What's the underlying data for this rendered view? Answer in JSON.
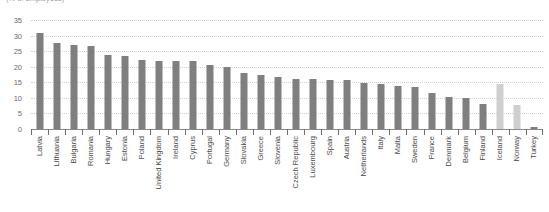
{
  "subtitle": "(% of employees)",
  "chart_data": {
    "type": "bar",
    "title": "",
    "subtitle": "(% of employees)",
    "xlabel": "",
    "ylabel": "",
    "ylim": [
      0,
      35
    ],
    "yticks": [
      0,
      5,
      10,
      15,
      20,
      25,
      30,
      35
    ],
    "grid": true,
    "legend": false,
    "orientation": "vertical",
    "categories": [
      "Latvia",
      "Lithuania",
      "Bulgaria",
      "Romania",
      "Hungary",
      "Estonia",
      "Poland",
      "United Kingdom",
      "Ireland",
      "Cyprus",
      "Portugal",
      "Germany",
      "Slovakia",
      "Greece",
      "Slovenia",
      "Czech Republic",
      "Luxembourg",
      "Spain",
      "Austria",
      "Netherlands",
      "Italy",
      "Malta",
      "Sweden",
      "France",
      "Denmark",
      "Belgium",
      "Finland",
      "Iceland",
      "Norway",
      "Turkey"
    ],
    "values": [
      30.9,
      27.6,
      27.1,
      26.7,
      23.7,
      23.4,
      22.2,
      21.8,
      21.7,
      21.7,
      20.6,
      20.0,
      17.9,
      17.2,
      16.8,
      16.2,
      16.0,
      15.8,
      15.7,
      14.9,
      14.6,
      13.8,
      13.6,
      11.6,
      10.2,
      9.8,
      8.0,
      14.5,
      7.6,
      0.5
    ],
    "bar_colors": [
      "#7f7f7f",
      "#7f7f7f",
      "#7f7f7f",
      "#7f7f7f",
      "#7f7f7f",
      "#7f7f7f",
      "#7f7f7f",
      "#7f7f7f",
      "#7f7f7f",
      "#7f7f7f",
      "#7f7f7f",
      "#7f7f7f",
      "#7f7f7f",
      "#7f7f7f",
      "#7f7f7f",
      "#7f7f7f",
      "#7f7f7f",
      "#7f7f7f",
      "#7f7f7f",
      "#7f7f7f",
      "#7f7f7f",
      "#7f7f7f",
      "#7f7f7f",
      "#7f7f7f",
      "#7f7f7f",
      "#7f7f7f",
      "#7f7f7f",
      "#cfcfcf",
      "#cfcfcf",
      "#7f7f7f"
    ]
  },
  "colors": {
    "bar_primary": "#7f7f7f",
    "bar_highlight": "#cfcfcf",
    "gridline": "#d2d2d2",
    "axis": "#8a8a8a",
    "tick_text": "#6b6b6b",
    "label_text": "#4a4a4a"
  }
}
